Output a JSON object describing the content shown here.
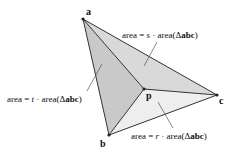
{
  "diagram": {
    "vertices": {
      "a": {
        "label": "a",
        "x": 83,
        "y": 19
      },
      "b": {
        "label": "b",
        "x": 109,
        "y": 135
      },
      "c": {
        "label": "c",
        "x": 217,
        "y": 95
      },
      "p": {
        "label": "p",
        "x": 144,
        "y": 89
      }
    },
    "regions": {
      "abp": {
        "fill": "#c9c9c9"
      },
      "apc": {
        "fill": "#d9d9d9"
      },
      "bpc": {
        "fill": "#eeeeee"
      }
    },
    "annotations": {
      "s": {
        "prefix": "area = ",
        "coef": "s",
        "mid": " · area(",
        "delta": "Δ",
        "tri": "abc",
        "suffix": ")"
      },
      "t": {
        "prefix": "area = ",
        "coef": "t",
        "mid": " · area(",
        "delta": "Δ",
        "tri": "abc",
        "suffix": ")"
      },
      "r": {
        "prefix": "area = ",
        "coef": "r",
        "mid": " · area(",
        "delta": "Δ",
        "tri": "abc",
        "suffix": ")"
      }
    },
    "stroke_color": "#333333"
  }
}
